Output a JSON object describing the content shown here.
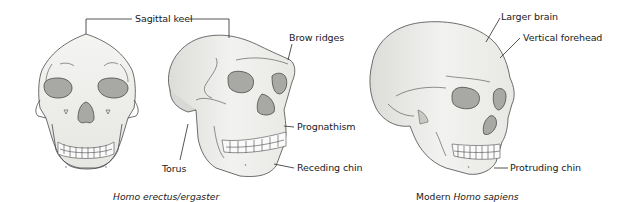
{
  "figure": {
    "labels": {
      "sagittal_keel": "Sagittal keel",
      "brow_ridges": "Brow ridges",
      "prognathism": "Prognathism",
      "torus": "Torus",
      "receding_chin": "Receding chin",
      "larger_brain": "Larger brain",
      "vertical_forehead": "Vertical forehead",
      "protruding_chin": "Protruding chin"
    },
    "captions": {
      "erectus": "Homo erectus/ergaster",
      "sapiens_prefix": "Modern ",
      "sapiens_italic": "Homo sapiens"
    },
    "colors": {
      "bone": "#eeeeec",
      "bone_shade": "#d9d9d6",
      "socket": "#a3a3a0",
      "outline": "#4a4a4a"
    }
  }
}
